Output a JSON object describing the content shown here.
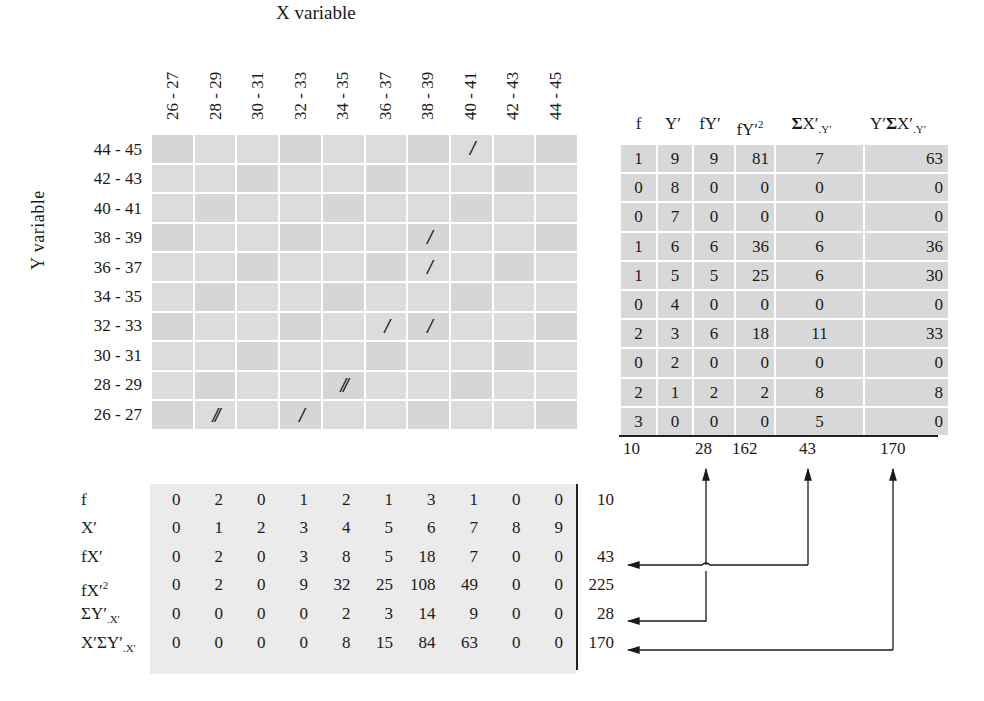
{
  "x_axis": {
    "title": "X variable",
    "intervals": [
      "26 - 27",
      "28 - 29",
      "30 - 31",
      "32 - 33",
      "34 - 35",
      "36 - 37",
      "38 - 39",
      "40 - 41",
      "42 - 43",
      "44 - 45"
    ]
  },
  "y_axis": {
    "title": "Y  variable",
    "intervals": [
      "44 - 45",
      "42 - 43",
      "40 - 41",
      "38 - 39",
      "36 - 37",
      "34 - 35",
      "32 - 33",
      "30 - 31",
      "28 - 29",
      "26 - 27"
    ]
  },
  "tallies": [
    [
      "",
      "",
      "",
      "",
      "",
      "",
      "",
      "/",
      "",
      ""
    ],
    [
      "",
      "",
      "",
      "",
      "",
      "",
      "",
      "",
      "",
      ""
    ],
    [
      "",
      "",
      "",
      "",
      "",
      "",
      "",
      "",
      "",
      ""
    ],
    [
      "",
      "",
      "",
      "",
      "",
      "",
      "/",
      "",
      "",
      ""
    ],
    [
      "",
      "",
      "",
      "",
      "",
      "",
      "/",
      "",
      "",
      ""
    ],
    [
      "",
      "",
      "",
      "",
      "",
      "",
      "",
      "",
      "",
      ""
    ],
    [
      "",
      "",
      "",
      "",
      "",
      "/",
      "/",
      "",
      "",
      ""
    ],
    [
      "",
      "",
      "",
      "",
      "",
      "",
      "",
      "",
      "",
      ""
    ],
    [
      "",
      "",
      "",
      "",
      "//",
      "",
      "",
      "",
      "",
      ""
    ],
    [
      "",
      "//",
      "",
      "/",
      "",
      "",
      "",
      "",
      "",
      ""
    ]
  ],
  "right_table": {
    "headers": [
      "f",
      "Y′",
      "fY′",
      "fY′²",
      "ΣX′.Y′",
      "Y′ΣX′.Y′"
    ],
    "rows": [
      [
        "1",
        "9",
        "9",
        "81",
        "7",
        "63"
      ],
      [
        "0",
        "8",
        "0",
        "0",
        "0",
        "0"
      ],
      [
        "0",
        "7",
        "0",
        "0",
        "0",
        "0"
      ],
      [
        "1",
        "6",
        "6",
        "36",
        "6",
        "36"
      ],
      [
        "1",
        "5",
        "5",
        "25",
        "6",
        "30"
      ],
      [
        "0",
        "4",
        "0",
        "0",
        "0",
        "0"
      ],
      [
        "2",
        "3",
        "6",
        "18",
        "11",
        "33"
      ],
      [
        "0",
        "2",
        "0",
        "0",
        "0",
        "0"
      ],
      [
        "2",
        "1",
        "2",
        "2",
        "8",
        "8"
      ],
      [
        "3",
        "0",
        "0",
        "0",
        "5",
        "0"
      ]
    ],
    "totals": {
      "f": "10",
      "fY": "28",
      "fY2": "162",
      "sumX": "43",
      "YsumX": "170"
    }
  },
  "bottom_table": {
    "rows": [
      {
        "label": "f",
        "values": [
          "0",
          "2",
          "0",
          "1",
          "2",
          "1",
          "3",
          "1",
          "0",
          "0"
        ],
        "total": "10"
      },
      {
        "label": "X′",
        "values": [
          "0",
          "1",
          "2",
          "3",
          "4",
          "5",
          "6",
          "7",
          "8",
          "9"
        ],
        "total": ""
      },
      {
        "label": "fX′",
        "values": [
          "0",
          "2",
          "0",
          "3",
          "8",
          "5",
          "18",
          "7",
          "0",
          "0"
        ],
        "total": "43"
      },
      {
        "label": "fX′²",
        "values": [
          "0",
          "2",
          "0",
          "9",
          "32",
          "25",
          "108",
          "49",
          "0",
          "0"
        ],
        "total": "225"
      },
      {
        "label": "ΣY′.X′",
        "values": [
          "0",
          "0",
          "0",
          "0",
          "2",
          "3",
          "14",
          "9",
          "0",
          "0"
        ],
        "total": "28"
      },
      {
        "label": "X′ΣY′.X′",
        "values": [
          "0",
          "0",
          "0",
          "0",
          "8",
          "15",
          "84",
          "63",
          "0",
          "0"
        ],
        "total": "170"
      }
    ]
  },
  "colors": {
    "cell": "#dcdcdc",
    "ink": "#1a1a1a",
    "bottom_shade": "#ebebeb"
  }
}
